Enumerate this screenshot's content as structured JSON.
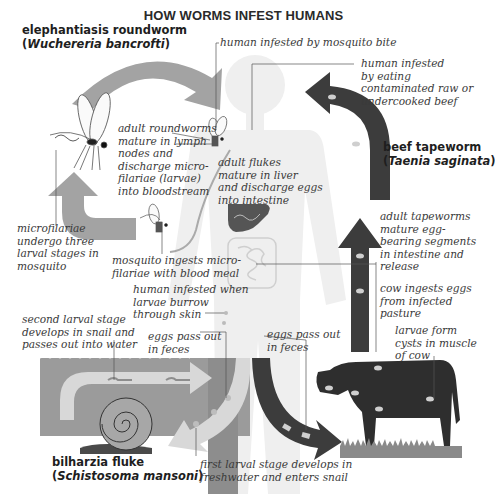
{
  "title": "HOW WORMS INFEST HUMANS",
  "colors": {
    "roundworm_arrow": "#a3a3a3",
    "tapeworm_arrow": "#3c3c3c",
    "fluke_water": "#9b9b9b",
    "fluke_arrow": "#d8d8d8",
    "human_silhouette": "#efefef",
    "liver": "#555555",
    "cow": "#2e2e2e",
    "grass": "#8a8a8a"
  },
  "species": {
    "roundworm": {
      "name": "elephantiasis roundworm",
      "open": "(",
      "scientific": "Wuchereria bancrofti",
      "close": ")"
    },
    "tapeworm": {
      "name": "beef tapeworm",
      "open": "(",
      "scientific": "Taenia saginata",
      "close": ")"
    },
    "fluke": {
      "name": "bilharzia fluke",
      "open": "(",
      "scientific": "Schistosoma mansoni",
      "close": ")"
    }
  },
  "annotations": {
    "mosquito_bite": "human infested by mosquito bite",
    "roundworm_mature": "adult roundworms\nmature in lymph\nnodes and\ndischarge micro-\nfilariae (larvae)\ninto bloodstream",
    "microfilariae_stages": "microfilariae\nundergo three\nlarval stages in\nmosquito",
    "mosquito_ingests": "mosquito ingests micro-\nfilariae with blood meal",
    "beef_infested": "human infested\nby eating\ncontaminated raw or\nundercooked beef",
    "flukes_mature": "adult flukes\nmature in liver\nand discharge eggs\ninto intestine",
    "tapeworm_mature": "adult tapeworms\nmature egg-\nbearing segments\nin intestine and\nrelease",
    "cow_ingests": "cow ingests eggs\nfrom infected\npasture",
    "larvae_cysts": "larvae form\ncysts in muscle\nof cow",
    "larvae_burrow": "human infested when\nlarvae burrow\nthrough skin",
    "second_larval": "second larval stage\ndevelops in snail and\npasses out into water",
    "eggs_feces_fluke": "eggs pass out\nin feces",
    "eggs_feces_tapeworm": "eggs pass out\nin feces",
    "first_larval": "first larval stage develops in\nfreshwater and enters snail"
  },
  "icons": {
    "human": "human-silhouette",
    "mosquito": "mosquito",
    "liver": "liver",
    "intestine": "intestine",
    "cow": "cow",
    "snail": "snail"
  }
}
